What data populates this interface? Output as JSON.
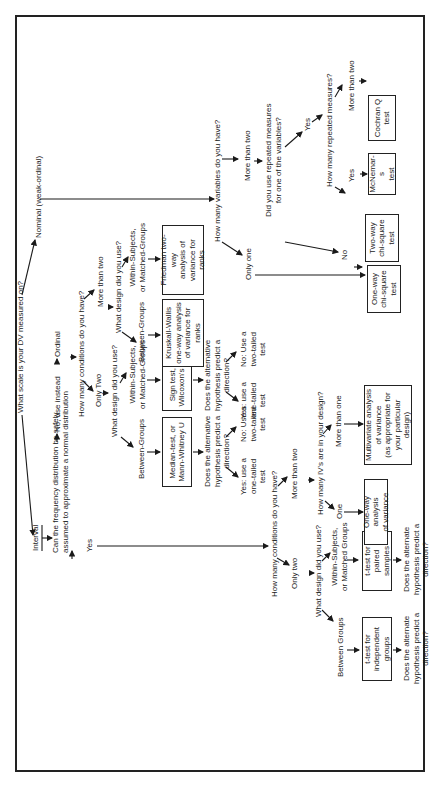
{
  "diagram": {
    "orientation": "rotated -90deg (reads bottom-to-top)",
    "root_question": "What scale is your DV measured on?",
    "scales": {
      "interval": "Interval",
      "ordinal": "Ordinal",
      "nominal": "Nominal (weak-ordinal)"
    },
    "normality_question": [
      "Can the frequency distribution be safely",
      "assumed to approximate a normal distribution"
    ],
    "normality_yes": "Yes",
    "normality_no": "No, use instead",
    "interval_branch": {
      "conditions_question": "How many conditions do you have?",
      "only_two": "Only two",
      "more_than_two": "More than two",
      "design_question": "What design did you use?",
      "between": "Between Groups",
      "within": [
        "Within-Subjects,",
        "or Matched Groups"
      ],
      "t_independent": [
        "t-test for",
        "independent groups"
      ],
      "t_paired": [
        "t-test for",
        "paired samples"
      ],
      "direction_q1": [
        "Does the alternate",
        "hypothesis predict a",
        "direction?"
      ],
      "direction_q2": [
        "Does the alternate",
        "hypothesis predict a",
        "direction?"
      ],
      "ivs_question": "How many IV's are in your design?",
      "one": "One",
      "more_than_one": "More than one",
      "one_way_anova": [
        "One-way analysis",
        "of variance"
      ],
      "manova": [
        "Multivariate analysis",
        "of variance",
        "(as appropriate for",
        "your particular",
        "design)"
      ]
    },
    "ordinal_branch": {
      "conditions_question": "How many conditions do you have?",
      "only_two": "Only Two",
      "more_than_two": "More than two",
      "design_question_two": "What design did you use?",
      "design_question_more": "What design did you use?",
      "between": "Between-Groups",
      "within": [
        "Within-Subjects,",
        "or Matched-Groups"
      ],
      "between_more": "Between-Groups",
      "within_more": [
        "Within-Subjects,",
        "or Matched-Groups"
      ],
      "median_test": [
        "Median-test, or",
        "Mann-Whitney U"
      ],
      "sign_test": [
        "Sign test, or",
        "Wilcoxon's test"
      ],
      "kruskal": [
        "Kruskall-Wallis",
        "one-way analysis",
        "of variance for",
        "ranks"
      ],
      "friedman": [
        "Friedman two-way",
        "analysis of",
        "variance for",
        "ranks"
      ],
      "direction_q_a": [
        "Does the alternative",
        "hypothesis predict a",
        "direction?"
      ],
      "direction_q_b": [
        "Does the alternative",
        "hypothesis predict a",
        "direction?"
      ],
      "yes_one_tailed": [
        "Yes: use a",
        "one-tailed",
        "test"
      ],
      "no_two_tailed": [
        "No: Use a",
        "two-tailed",
        "test"
      ]
    },
    "nominal_branch": {
      "variables_question": "How many variables do you have?",
      "only_one": "Only one",
      "more_than_two": "More than two",
      "repeated_question": [
        "Did you use repeated measures",
        "for one of the variables?"
      ],
      "yes": "Yes",
      "no": "No",
      "how_many_repeated": "How many repeated measures?",
      "yes2": "Yes",
      "more_than_two_rm": "More than two",
      "one_way_chi": [
        "One-way",
        "chi-square",
        "test"
      ],
      "two_way_chi": [
        "Two-way",
        "chi-square",
        "test"
      ],
      "mcnemar": [
        "McNemar-s",
        "test"
      ],
      "cochran": [
        "Cochran Q",
        "test"
      ]
    }
  }
}
